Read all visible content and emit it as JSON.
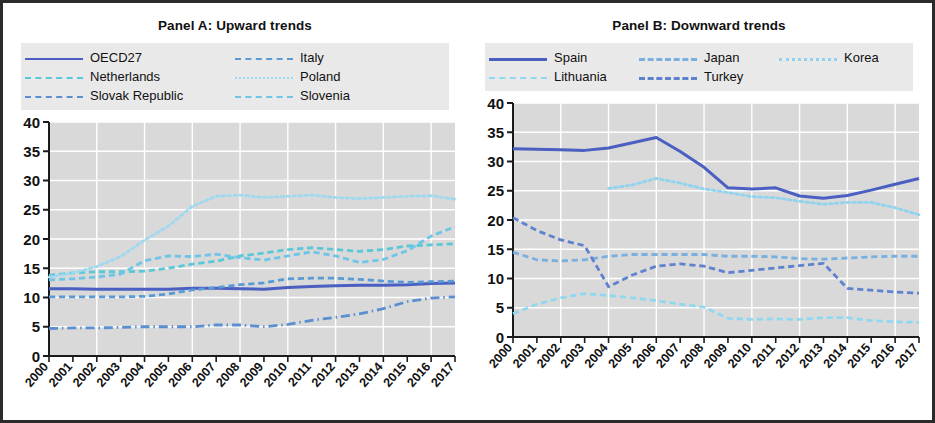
{
  "figure": {
    "background": "#ffffff",
    "frame_color": "#2b2b2b",
    "plot_background": "#d9d9d9",
    "gridline_color": "#ffffff"
  },
  "panelA": {
    "title": "Panel A: Upward trends",
    "legend": [
      {
        "label": "OECD27",
        "color": "#4a5fc1",
        "style": "solid",
        "width": 2.8
      },
      {
        "label": "Italy",
        "color": "#5b9bd5",
        "style": "dashed",
        "width": 2.6
      },
      {
        "label": "Netherlands",
        "color": "#5bc8d8",
        "style": "dashed",
        "width": 2.4
      },
      {
        "label": "Poland",
        "color": "#9fd9ef",
        "style": "dotted",
        "width": 2.4
      },
      {
        "label": "Slovak Republic",
        "color": "#5b8fd0",
        "style": "dashdot",
        "width": 2.6
      },
      {
        "label": "Slovenia",
        "color": "#6ec5e8",
        "style": "dashed",
        "width": 2.6
      }
    ],
    "yaxis": {
      "min": 0,
      "max": 40,
      "ticks": [
        0,
        5,
        10,
        15,
        20,
        25,
        30,
        35,
        40
      ]
    },
    "xaxis": {
      "labels": [
        "2000",
        "2001",
        "2002",
        "2003",
        "2004",
        "2005",
        "2006",
        "2007",
        "2008",
        "2009",
        "2010",
        "2011",
        "2012",
        "2013",
        "2014",
        "2015",
        "2016",
        "2017"
      ]
    }
  },
  "panelB": {
    "title": "Panel B: Downward trends",
    "legend": [
      {
        "label": "Spain",
        "color": "#4a5fc1",
        "style": "solid",
        "width": 3.0
      },
      {
        "label": "Japan",
        "color": "#7ab0e0",
        "style": "dashed",
        "width": 3.0
      },
      {
        "label": "Korea",
        "color": "#8fd3ee",
        "style": "dotted",
        "width": 3.0
      },
      {
        "label": "Lithuania",
        "color": "#8fd9f0",
        "style": "dashed",
        "width": 2.6
      },
      {
        "label": "Turkey",
        "color": "#5f82cf",
        "style": "dashed",
        "width": 3.0
      }
    ],
    "yaxis": {
      "min": 0,
      "max": 40,
      "ticks": [
        0,
        5,
        10,
        15,
        20,
        25,
        30,
        35,
        40
      ]
    },
    "xaxis": {
      "labels": [
        "2000",
        "2001",
        "2002",
        "2003",
        "2004",
        "2005",
        "2006",
        "2007",
        "2008",
        "2009",
        "2010",
        "2011",
        "2012",
        "2013",
        "2014",
        "2015",
        "2016",
        "2017"
      ]
    }
  },
  "chart_data": [
    {
      "type": "line",
      "title": "Panel A: Upward trends",
      "xlabel": "",
      "ylabel": "",
      "xlim": [
        2000,
        2017
      ],
      "ylim": [
        0,
        40
      ],
      "grid": true,
      "legend_position": "top",
      "x": [
        2000,
        2001,
        2002,
        2003,
        2004,
        2005,
        2006,
        2007,
        2008,
        2009,
        2010,
        2011,
        2012,
        2013,
        2014,
        2015,
        2016,
        2017
      ],
      "series": [
        {
          "name": "OECD27",
          "color": "#4a5fc1",
          "style": "solid",
          "values": [
            11.5,
            11.5,
            11.4,
            11.4,
            11.4,
            11.4,
            11.6,
            11.6,
            11.5,
            11.4,
            11.7,
            11.9,
            12.0,
            12.1,
            12.1,
            12.2,
            12.4,
            12.5
          ]
        },
        {
          "name": "Italy",
          "color": "#5b9bd5",
          "style": "dashed",
          "values": [
            10.1,
            10.1,
            10.1,
            10.1,
            10.2,
            10.6,
            11.3,
            11.7,
            12.2,
            12.5,
            13.2,
            13.3,
            13.3,
            13.1,
            12.8,
            12.6,
            12.7,
            12.8
          ]
        },
        {
          "name": "Netherlands",
          "color": "#5bc8d8",
          "style": "dashed",
          "values": [
            13.8,
            14.2,
            14.4,
            14.4,
            14.5,
            15.0,
            15.7,
            16.2,
            17.1,
            17.6,
            18.2,
            18.5,
            18.2,
            17.9,
            18.2,
            18.8,
            19.0,
            19.2
          ]
        },
        {
          "name": "Poland",
          "color": "#9fd9ef",
          "style": "dotted",
          "values": [
            13.5,
            14.2,
            15.3,
            17.0,
            19.8,
            22.2,
            25.6,
            27.3,
            27.5,
            27.1,
            27.3,
            27.5,
            27.1,
            26.9,
            27.1,
            27.3,
            27.4,
            26.8
          ]
        },
        {
          "name": "Slovak Republic",
          "color": "#5b8fd0",
          "style": "dashdot",
          "values": [
            4.7,
            4.8,
            4.8,
            4.9,
            5.0,
            5.0,
            5.0,
            5.3,
            5.3,
            5.0,
            5.4,
            6.1,
            6.6,
            7.2,
            8.1,
            9.3,
            9.9,
            10.1
          ]
        },
        {
          "name": "Slovenia",
          "color": "#6ec5e8",
          "style": "dashed",
          "values": [
            13.0,
            13.2,
            13.5,
            14.0,
            16.3,
            17.1,
            17.0,
            17.4,
            16.8,
            16.4,
            17.1,
            17.8,
            17.1,
            16.0,
            16.5,
            18.0,
            20.5,
            22.1
          ]
        }
      ]
    },
    {
      "type": "line",
      "title": "Panel B: Downward trends",
      "xlabel": "",
      "ylabel": "",
      "xlim": [
        2000,
        2017
      ],
      "ylim": [
        0,
        40
      ],
      "grid": true,
      "legend_position": "top",
      "x": [
        2000,
        2001,
        2002,
        2003,
        2004,
        2005,
        2006,
        2007,
        2008,
        2009,
        2010,
        2011,
        2012,
        2013,
        2014,
        2015,
        2016,
        2017
      ],
      "series": [
        {
          "name": "Spain",
          "color": "#4a5fc1",
          "style": "solid",
          "values": [
            32.2,
            32.1,
            32.0,
            31.9,
            32.3,
            33.2,
            34.1,
            31.7,
            29.0,
            25.5,
            25.3,
            25.5,
            24.1,
            23.7,
            24.2,
            25.1,
            26.1,
            27.1
          ]
        },
        {
          "name": "Japan",
          "color": "#7ab0e0",
          "style": "dashed",
          "values": [
            14.5,
            13.2,
            13.0,
            13.2,
            13.8,
            14.1,
            14.1,
            14.1,
            14.1,
            13.8,
            13.8,
            13.7,
            13.4,
            13.3,
            13.5,
            13.7,
            13.8,
            13.8
          ]
        },
        {
          "name": "Korea",
          "color": "#8fd3ee",
          "style": "dotted",
          "values": [
            null,
            null,
            null,
            null,
            25.4,
            26.0,
            27.1,
            26.3,
            25.3,
            24.7,
            24.0,
            23.8,
            23.2,
            22.7,
            23.0,
            23.0,
            22.1,
            20.9
          ]
        },
        {
          "name": "Lithuania",
          "color": "#8fd9f0",
          "style": "dashed",
          "values": [
            4.0,
            5.6,
            6.7,
            7.4,
            7.1,
            6.7,
            6.2,
            5.6,
            5.1,
            3.2,
            3.0,
            3.1,
            3.0,
            3.3,
            3.3,
            2.8,
            2.6,
            2.5
          ]
        },
        {
          "name": "Turkey",
          "color": "#5f82cf",
          "style": "dashed",
          "values": [
            20.4,
            18.2,
            16.6,
            15.6,
            8.6,
            10.6,
            12.1,
            12.5,
            12.1,
            11.0,
            11.4,
            11.8,
            12.2,
            12.6,
            8.3,
            8.0,
            7.7,
            7.5
          ]
        }
      ]
    }
  ]
}
